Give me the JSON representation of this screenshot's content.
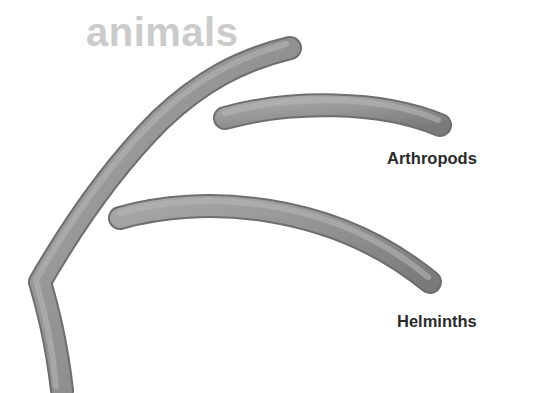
{
  "diagram": {
    "title": "animals",
    "branches": [
      {
        "label": "Arthropods"
      },
      {
        "label": "Helminths"
      }
    ],
    "colors": {
      "title": "#cbcbcb",
      "branch": "#8c8c8c",
      "branch_shadow": "#6e6e6e",
      "label": "#2b2b2b"
    }
  }
}
